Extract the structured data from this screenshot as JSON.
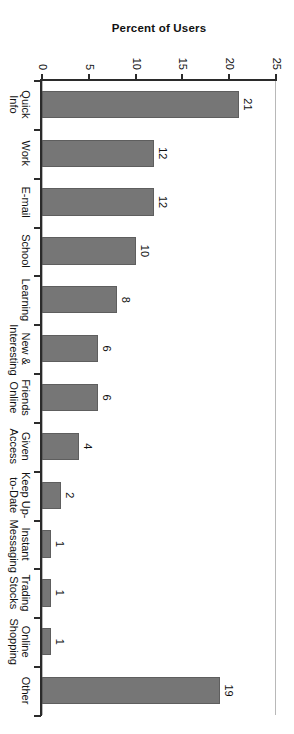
{
  "chart_data": {
    "type": "bar",
    "title": "",
    "xlabel": "",
    "ylabel": "Percent of Users",
    "ylim": [
      0,
      25
    ],
    "yticks": [
      0,
      5,
      10,
      15,
      20,
      25
    ],
    "grid": false,
    "legend": null,
    "orientation": "vertical",
    "page_rotation_deg": 90,
    "bar_color": "#767676",
    "bar_edge_color": "#5e5e5e",
    "axis_color": "#2b2b2b",
    "frame_color": "#b8b8b8",
    "background_color": "#ffffff",
    "categories": [
      "Quick Info",
      "Work",
      "E-mail",
      "School",
      "Learning",
      "New &\nInteresting",
      "Friends\nOnline",
      "Given\nAccess",
      "Keep Up-\nto-Date",
      "Instant\nMessaging",
      "Trading\nStocks",
      "Online\nShopping",
      "Other"
    ],
    "values": [
      21,
      12,
      12,
      10,
      8,
      6,
      6,
      4,
      2,
      1,
      1,
      1,
      19
    ],
    "data_labels": [
      "21",
      "12",
      "12",
      "10",
      "8",
      "6",
      "6",
      "4",
      "2",
      "1",
      "1",
      "1",
      "19"
    ]
  },
  "axis": {
    "value_axis_title": "Percent of Users",
    "value_tick_labels": [
      "0",
      "5",
      "10",
      "15",
      "20",
      "25"
    ]
  }
}
